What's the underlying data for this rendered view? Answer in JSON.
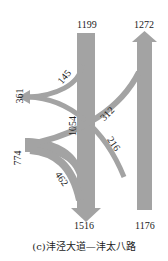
{
  "diagram": {
    "type": "traffic-flow",
    "caption": "(c)沣泾大道—沣太八路",
    "flow_color": "#a3a3a3",
    "flows": {
      "north_in": "1199",
      "north_out": "1272",
      "south_out": "1516",
      "south_in": "1176",
      "west_out": "361",
      "west_in": "774",
      "through_south": "1054",
      "left_north_to_west": "145",
      "cross_312": "312",
      "cross_216": "216",
      "right_west_to_south": "462"
    }
  }
}
